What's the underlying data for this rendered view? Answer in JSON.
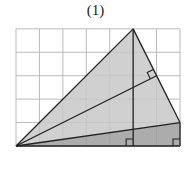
{
  "figure": {
    "label": "(1)",
    "grid": {
      "cols": 7,
      "rows": 5,
      "origin_px": [
        16,
        146
      ],
      "cell_px": 23.43,
      "line_color": "#b9b9b9"
    },
    "points": {
      "A": [
        0,
        0
      ],
      "B": [
        5,
        5
      ],
      "C": [
        7,
        1
      ],
      "D": [
        5,
        0
      ],
      "E": [
        6,
        3
      ],
      "F": [
        7,
        0
      ]
    },
    "shapes": {
      "triangle_ABC": {
        "fill": "#c8c8c8"
      },
      "triangle_ACF": {
        "fill": "#9d9d9d"
      }
    },
    "segments": [
      "A-B",
      "B-C",
      "A-C",
      "A-E",
      "B-D",
      "A-F",
      "C-F"
    ],
    "right_angle_marks": [
      "E",
      "D",
      "F"
    ],
    "stroke_color": "#222222"
  }
}
